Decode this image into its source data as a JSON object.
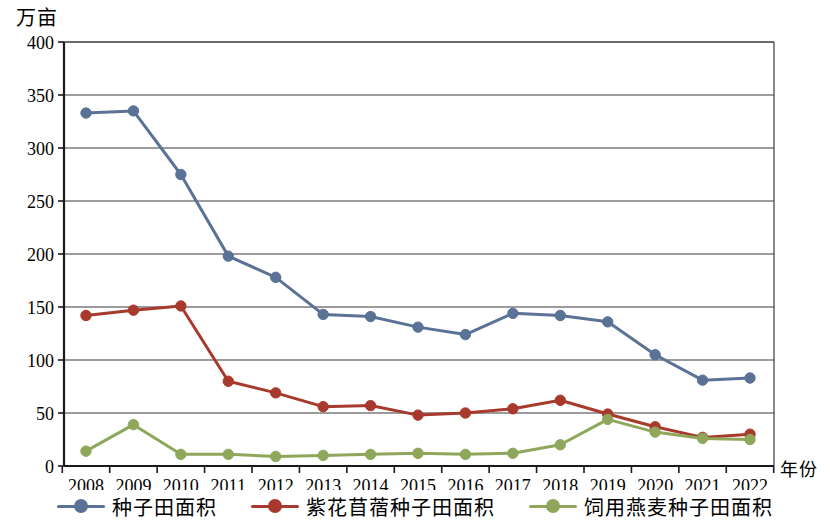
{
  "chart_data": {
    "type": "line",
    "title": "",
    "xlabel": "年份",
    "ylabel": "万亩",
    "x": [
      2008,
      2009,
      2010,
      2011,
      2012,
      2013,
      2014,
      2015,
      2016,
      2017,
      2018,
      2019,
      2020,
      2021,
      2022
    ],
    "categories": [
      "2008",
      "2009",
      "2010",
      "2011",
      "2012",
      "2013",
      "2014",
      "2015",
      "2016",
      "2017",
      "2018",
      "2019",
      "2020",
      "2021",
      "2022"
    ],
    "ylim": [
      0,
      400
    ],
    "yticks": [
      "0",
      "50",
      "100",
      "150",
      "200",
      "250",
      "300",
      "350",
      "400"
    ],
    "ytick_values": [
      0,
      50,
      100,
      150,
      200,
      250,
      300,
      350,
      400
    ],
    "grid": "horizontal",
    "legend_position": "bottom",
    "series": [
      {
        "name": "种子田面积",
        "color": "#5a7296",
        "values": [
          333,
          335,
          275,
          198,
          178,
          143,
          141,
          131,
          124,
          144,
          142,
          136,
          105,
          81,
          83
        ]
      },
      {
        "name": "紫花苜蓿种子田面积",
        "color": "#a73a2c",
        "values": [
          142,
          147,
          151,
          80,
          69,
          56,
          57,
          48,
          50,
          54,
          62,
          49,
          37,
          27,
          30
        ]
      },
      {
        "name": "饲用燕麦种子田面积",
        "color": "#8ea75a",
        "values": [
          14,
          39,
          11,
          11,
          9,
          10,
          11,
          12,
          11,
          12,
          20,
          44,
          32,
          26,
          25
        ]
      }
    ]
  },
  "axes": {
    "y_unit_label": "万亩",
    "x_unit_label": "年份"
  },
  "legend": {
    "items": [
      {
        "label": "种子田面积",
        "color": "#5a7296"
      },
      {
        "label": "紫花苜蓿种子田面积",
        "color": "#a73a2c"
      },
      {
        "label": "饲用燕麦种子田面积",
        "color": "#8ea75a"
      }
    ]
  }
}
